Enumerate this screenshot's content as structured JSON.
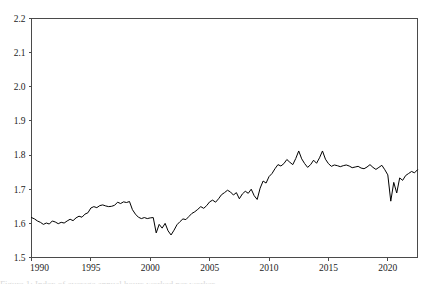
{
  "figure": {
    "background_color": "#ffffff",
    "line_color": "#000000",
    "axis_color": "#4a4a4a",
    "caption_partial": "Figure 1: Index of average annual hours worked per worker"
  },
  "chart_data": {
    "type": "line",
    "title": "",
    "subtitle": "",
    "xlabel": "",
    "ylabel": "",
    "xlim": [
      1990,
      2022.5
    ],
    "ylim": [
      1.5,
      2.2
    ],
    "grid": false,
    "legend": null,
    "legend_position": "none",
    "xticks": [
      1990,
      1995,
      2000,
      2005,
      2010,
      2015,
      2020
    ],
    "xtick_labels": [
      "1990",
      "1995",
      "2000",
      "2005",
      "2010",
      "2015",
      "2020"
    ],
    "yticks": [
      1.5,
      1.6,
      1.7,
      1.8,
      1.9,
      2.0,
      2.1,
      2.2
    ],
    "ytick_labels": [
      "1.5",
      "1.6",
      "1.7",
      "1.8",
      "1.9",
      "2.0",
      "2.1",
      "2.2"
    ],
    "series": [
      {
        "name": "series-1",
        "color": "#000000",
        "x": [
          1990.0,
          1990.25,
          1990.5,
          1990.75,
          1991.0,
          1991.25,
          1991.5,
          1991.75,
          1992.0,
          1992.25,
          1992.5,
          1992.75,
          1993.0,
          1993.25,
          1993.5,
          1993.75,
          1994.0,
          1994.25,
          1994.5,
          1994.75,
          1995.0,
          1995.25,
          1995.5,
          1995.75,
          1996.0,
          1996.25,
          1996.5,
          1996.75,
          1997.0,
          1997.25,
          1997.5,
          1997.75,
          1998.0,
          1998.25,
          1998.5,
          1998.75,
          1999.0,
          1999.25,
          1999.5,
          1999.75,
          2000.0,
          2000.25,
          2000.5,
          2000.75,
          2001.0,
          2001.25,
          2001.5,
          2001.75,
          2002.0,
          2002.25,
          2002.5,
          2002.75,
          2003.0,
          2003.25,
          2003.5,
          2003.75,
          2004.0,
          2004.25,
          2004.5,
          2004.75,
          2005.0,
          2005.25,
          2005.5,
          2005.75,
          2006.0,
          2006.25,
          2006.5,
          2006.75,
          2007.0,
          2007.25,
          2007.5,
          2007.75,
          2008.0,
          2008.25,
          2008.5,
          2008.75,
          2009.0,
          2009.25,
          2009.5,
          2009.75,
          2010.0,
          2010.25,
          2010.5,
          2010.75,
          2011.0,
          2011.25,
          2011.5,
          2011.75,
          2012.0,
          2012.25,
          2012.5,
          2012.75,
          2013.0,
          2013.25,
          2013.5,
          2013.75,
          2014.0,
          2014.25,
          2014.5,
          2014.75,
          2015.0,
          2015.25,
          2015.5,
          2015.75,
          2016.0,
          2016.25,
          2016.5,
          2016.75,
          2017.0,
          2017.25,
          2017.5,
          2017.75,
          2018.0,
          2018.25,
          2018.5,
          2018.75,
          2019.0,
          2019.25,
          2019.5,
          2019.75,
          2020.0,
          2020.25,
          2020.5,
          2020.75,
          2021.0,
          2021.25,
          2021.5,
          2021.75,
          2022.0,
          2022.25,
          2022.5
        ],
        "y": [
          1.617,
          1.613,
          1.607,
          1.603,
          1.597,
          1.601,
          1.598,
          1.607,
          1.604,
          1.599,
          1.603,
          1.601,
          1.607,
          1.612,
          1.608,
          1.616,
          1.621,
          1.618,
          1.627,
          1.631,
          1.645,
          1.649,
          1.646,
          1.652,
          1.654,
          1.651,
          1.649,
          1.65,
          1.653,
          1.662,
          1.658,
          1.663,
          1.661,
          1.664,
          1.64,
          1.627,
          1.618,
          1.614,
          1.617,
          1.614,
          1.616,
          1.617,
          1.572,
          1.597,
          1.586,
          1.6,
          1.578,
          1.566,
          1.58,
          1.596,
          1.605,
          1.613,
          1.611,
          1.62,
          1.629,
          1.634,
          1.641,
          1.649,
          1.644,
          1.652,
          1.663,
          1.668,
          1.662,
          1.672,
          1.684,
          1.69,
          1.697,
          1.692,
          1.683,
          1.69,
          1.672,
          1.686,
          1.694,
          1.688,
          1.7,
          1.681,
          1.67,
          1.703,
          1.724,
          1.718,
          1.737,
          1.746,
          1.76,
          1.772,
          1.768,
          1.775,
          1.787,
          1.779,
          1.772,
          1.79,
          1.812,
          1.789,
          1.775,
          1.764,
          1.772,
          1.785,
          1.776,
          1.792,
          1.812,
          1.788,
          1.775,
          1.767,
          1.771,
          1.769,
          1.766,
          1.769,
          1.771,
          1.768,
          1.763,
          1.765,
          1.767,
          1.762,
          1.76,
          1.765,
          1.772,
          1.764,
          1.758,
          1.764,
          1.77,
          1.757,
          1.742,
          1.665,
          1.72,
          1.689,
          1.733,
          1.726,
          1.74,
          1.746,
          1.752,
          1.748,
          1.757
        ]
      }
    ]
  }
}
